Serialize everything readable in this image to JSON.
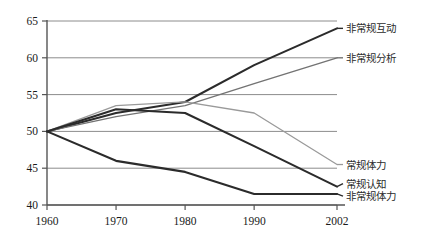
{
  "chart_data": {
    "type": "line",
    "title": "",
    "xlabel": "",
    "ylabel": "",
    "x": [
      1960,
      1970,
      1980,
      1990,
      2002
    ],
    "xtick_labels": [
      "1960",
      "1970",
      "1980",
      "1990",
      "2002"
    ],
    "ytick_labels": [
      "40",
      "45",
      "50",
      "55",
      "60",
      "65"
    ],
    "yticks": [
      40,
      45,
      50,
      55,
      60,
      65
    ],
    "ylim": [
      40,
      65
    ],
    "xlim": [
      1960,
      2002
    ],
    "grid": "horizontal",
    "legend_position": "right-inline",
    "series": [
      {
        "name": "非常规互动",
        "values": [
          50,
          52.5,
          54,
          59,
          64
        ],
        "color": "#2b2b2b",
        "width": 2.1,
        "label_y": 64
      },
      {
        "name": "非常规分析",
        "values": [
          50,
          52,
          53.5,
          56.5,
          60
        ],
        "color": "#737373",
        "width": 1.4,
        "label_y": 60
      },
      {
        "name": "常规体力",
        "values": [
          50,
          53.5,
          54,
          52.5,
          45.5
        ],
        "color": "#9a9a9a",
        "width": 1.3,
        "label_y": 45.5
      },
      {
        "name": "常规认知",
        "values": [
          50,
          53,
          52.5,
          48,
          42.5
        ],
        "color": "#2b2b2b",
        "width": 2.1,
        "label_y": 42.9
      },
      {
        "name": "非常规体力",
        "values": [
          50,
          46,
          44.5,
          41.5,
          41.5
        ],
        "color": "#2b2b2b",
        "width": 2.1,
        "label_y": 41.2
      }
    ]
  },
  "axis": {
    "axis_color": "#555555",
    "grid_color": "#8c8c8c"
  }
}
